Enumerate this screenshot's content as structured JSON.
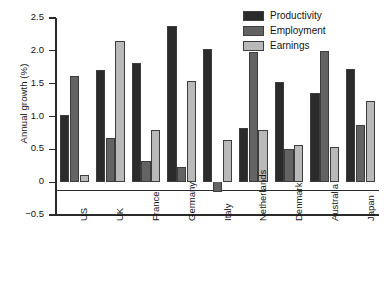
{
  "chart_data": {
    "type": "bar",
    "title": "",
    "subtitle": "",
    "xlabel": "",
    "ylabel": "Annual growth (%)",
    "ylim": [
      -0.5,
      2.5
    ],
    "yticks": [
      "2.5",
      "2.0",
      "1.5",
      "1.0",
      "0.5",
      "0",
      "-0.5"
    ],
    "ytick_values": [
      2.5,
      2.0,
      1.5,
      1.0,
      0.5,
      0,
      -0.5
    ],
    "grid": false,
    "legend_position": "top-right",
    "categories": [
      "US",
      "UK",
      "France",
      "Germany",
      "Italy",
      "Netherlands",
      "Denmark",
      "Australia",
      "Japan"
    ],
    "series": [
      {
        "name": "Productivity",
        "color": "#2b2b2b",
        "values": [
          1.03,
          1.71,
          1.82,
          2.38,
          2.03,
          0.82,
          1.52,
          1.36,
          1.73
        ]
      },
      {
        "name": "Employment",
        "color": "#636363",
        "values": [
          1.61,
          0.67,
          0.32,
          0.23,
          -0.15,
          1.98,
          0.5,
          2.0,
          0.87
        ]
      },
      {
        "name": "Earnings",
        "color": "#b9b9b9",
        "values": [
          0.11,
          2.15,
          0.8,
          1.54,
          0.64,
          0.8,
          0.57,
          0.54,
          1.23
        ]
      }
    ]
  }
}
